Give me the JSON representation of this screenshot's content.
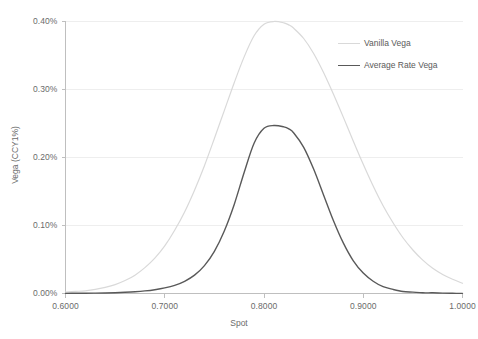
{
  "chart_data": {
    "type": "line",
    "title": "",
    "xlabel": "Spot",
    "ylabel": "Vega (CCY1%)",
    "xlim": [
      0.6,
      1.0
    ],
    "ylim": [
      0.0,
      0.004
    ],
    "grid": true,
    "legend_position": "top-right",
    "xtick_labels": [
      "0.6000",
      "0.7000",
      "0.8000",
      "0.9000",
      "1.0000"
    ],
    "xtick_values": [
      0.6,
      0.7,
      0.8,
      0.9,
      1.0
    ],
    "ytick_labels": [
      "0.00%",
      "0.10%",
      "0.20%",
      "0.30%",
      "0.40%"
    ],
    "ytick_values": [
      0.0,
      0.001,
      0.002,
      0.003,
      0.004
    ],
    "x": [
      0.6,
      0.61,
      0.62,
      0.63,
      0.64,
      0.65,
      0.66,
      0.67,
      0.68,
      0.69,
      0.7,
      0.71,
      0.72,
      0.73,
      0.74,
      0.75,
      0.76,
      0.77,
      0.78,
      0.79,
      0.8,
      0.81,
      0.82,
      0.825,
      0.83,
      0.84,
      0.85,
      0.86,
      0.87,
      0.88,
      0.89,
      0.9,
      0.91,
      0.92,
      0.93,
      0.94,
      0.95,
      0.96,
      0.97,
      0.98,
      0.99,
      1.0
    ],
    "series": [
      {
        "name": "Vanilla Vega",
        "color": "#d9d9d9",
        "width": 1.2,
        "values": [
          2e-05,
          3e-05,
          4e-05,
          6e-05,
          9e-05,
          0.00013,
          0.00019,
          0.00027,
          0.00038,
          0.00052,
          0.0007,
          0.00093,
          0.0012,
          0.00152,
          0.00188,
          0.00228,
          0.00269,
          0.0031,
          0.00348,
          0.00379,
          0.00396,
          0.004,
          0.00398,
          0.00395,
          0.0039,
          0.00375,
          0.00353,
          0.00325,
          0.00293,
          0.00259,
          0.00224,
          0.0019,
          0.00158,
          0.00129,
          0.00104,
          0.00082,
          0.00064,
          0.00049,
          0.00037,
          0.00028,
          0.00021,
          0.00015
        ]
      },
      {
        "name": "Average Rate Vega",
        "color": "#595959",
        "width": 1.4,
        "values": [
          2e-06,
          3e-06,
          4e-06,
          6e-06,
          8e-06,
          1.2e-05,
          1.8e-05,
          2.6e-05,
          3.8e-05,
          5.6e-05,
          8.2e-05,
          0.00012,
          0.00018,
          0.00027,
          0.00041,
          0.00062,
          0.00092,
          0.00131,
          0.00178,
          0.00221,
          0.00243,
          0.00247,
          0.00245,
          0.00242,
          0.00236,
          0.00215,
          0.00183,
          0.00145,
          0.00107,
          0.00074,
          0.00048,
          0.0003,
          0.00018,
          0.0001,
          6e-05,
          3e-05,
          2e-05,
          1e-05,
          1e-05,
          5e-06,
          3e-06,
          2e-06
        ]
      }
    ]
  },
  "axes": {
    "x_title": "Spot",
    "y_title": "Vega (CCY1%)"
  },
  "legend": {
    "items": [
      {
        "label": "Vanilla Vega",
        "color": "#d9d9d9",
        "width": 1.2
      },
      {
        "label": "Average Rate Vega",
        "color": "#595959",
        "width": 1.6
      }
    ]
  },
  "colors": {
    "gridline": "#eeeeee",
    "axis": "#bfbfbf",
    "text": "#6b6b6b",
    "vanilla": "#d9d9d9",
    "average_rate": "#595959"
  }
}
